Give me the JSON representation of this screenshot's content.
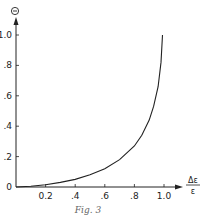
{
  "chart_data": {
    "type": "line",
    "title": "",
    "caption": "Fig. 3",
    "xlabel": "Δε/ε",
    "xlabel_numerator": "Δε",
    "xlabel_denominator": "ε",
    "ylabel": "Θ",
    "xlim": [
      0,
      1.0
    ],
    "ylim": [
      0,
      1.0
    ],
    "grid": false,
    "legend": null,
    "x_ticks": [
      "0.2",
      ".4",
      ".6",
      ".8",
      "1.0"
    ],
    "x_tick_values": [
      0.2,
      0.4,
      0.6,
      0.8,
      1.0
    ],
    "y_ticks": [
      "0",
      ".2",
      ".4",
      ".6",
      ".8",
      "1.0"
    ],
    "y_tick_values": [
      0,
      0.2,
      0.4,
      0.6,
      0.8,
      1.0
    ],
    "series": [
      {
        "name": "Θ",
        "x": [
          0.0,
          0.1,
          0.2,
          0.3,
          0.4,
          0.5,
          0.6,
          0.7,
          0.8,
          0.85,
          0.9,
          0.93,
          0.96,
          0.98,
          0.99
        ],
        "y": [
          0.0,
          0.005,
          0.015,
          0.03,
          0.05,
          0.08,
          0.12,
          0.18,
          0.27,
          0.34,
          0.44,
          0.53,
          0.66,
          0.82,
          1.0
        ]
      }
    ]
  },
  "colors": {
    "ink": "#222222",
    "background": "#ffffff"
  }
}
